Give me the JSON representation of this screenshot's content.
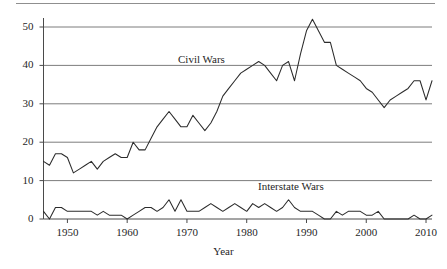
{
  "figure": {
    "background_color": "#ffffff",
    "line_color": "#2b2b2b",
    "grid_color": "#6e6e6e",
    "axis_color": "#4a4a4a"
  },
  "axis_titles": {
    "x": "Year",
    "y": ""
  },
  "series_labels": {
    "civil_wars": "Civil Wars",
    "interstate_wars": "Interstate Wars"
  },
  "chart_data": {
    "type": "line",
    "title": "",
    "subtitle": "",
    "xlabel": "Year",
    "ylabel": "",
    "xlim": [
      1946,
      2011
    ],
    "ylim": [
      0,
      52
    ],
    "xticks": [
      1950,
      1960,
      1970,
      1980,
      1990,
      2000,
      2010
    ],
    "xtick_labels": [
      "1950",
      "1960",
      "1970",
      "1980",
      "1990",
      "2000",
      "2010"
    ],
    "yticks": [
      0,
      10,
      20,
      30,
      40,
      50
    ],
    "ytick_labels": [
      "0",
      "10",
      "20",
      "30",
      "40",
      "50"
    ],
    "grid": "horizontal",
    "legend_position": "inline-annotations",
    "annotations": [
      {
        "text": "Civil Wars",
        "x": 1975,
        "y": 43
      },
      {
        "text": "Interstate Wars",
        "x": 1992,
        "y": 7.5
      }
    ],
    "x": [
      1946,
      1947,
      1948,
      1949,
      1950,
      1951,
      1952,
      1953,
      1954,
      1955,
      1956,
      1957,
      1958,
      1959,
      1960,
      1961,
      1962,
      1963,
      1964,
      1965,
      1966,
      1967,
      1968,
      1969,
      1970,
      1971,
      1972,
      1973,
      1974,
      1975,
      1976,
      1977,
      1978,
      1979,
      1980,
      1981,
      1982,
      1983,
      1984,
      1985,
      1986,
      1987,
      1988,
      1989,
      1990,
      1991,
      1992,
      1993,
      1994,
      1995,
      1996,
      1997,
      1998,
      1999,
      2000,
      2001,
      2002,
      2003,
      2004,
      2005,
      2006,
      2007,
      2008,
      2009,
      2010,
      2011
    ],
    "series": [
      {
        "name": "Civil Wars",
        "values": [
          15,
          14,
          17,
          17,
          16,
          12,
          13,
          14,
          15,
          13,
          15,
          16,
          17,
          16,
          16,
          20,
          18,
          18,
          21,
          24,
          26,
          28,
          26,
          24,
          24,
          27,
          25,
          23,
          25,
          28,
          32,
          34,
          36,
          38,
          39,
          40,
          41,
          40,
          38,
          36,
          40,
          41,
          36,
          43,
          49,
          52,
          49,
          46,
          46,
          40,
          39,
          38,
          37,
          36,
          34,
          33,
          31,
          29,
          31,
          32,
          33,
          34,
          36,
          36,
          31,
          36
        ]
      },
      {
        "name": "Interstate Wars",
        "values": [
          2,
          0,
          3,
          3,
          2,
          2,
          2,
          2,
          2,
          1,
          2,
          1,
          1,
          1,
          0,
          1,
          2,
          3,
          3,
          2,
          3,
          5,
          2,
          5,
          2,
          2,
          2,
          3,
          4,
          3,
          2,
          3,
          4,
          3,
          2,
          4,
          3,
          4,
          3,
          2,
          3,
          5,
          3,
          2,
          2,
          2,
          1,
          0,
          0,
          2,
          1,
          2,
          2,
          2,
          1,
          1,
          2,
          0,
          0,
          0,
          0,
          0,
          1,
          0,
          0,
          1
        ]
      }
    ]
  }
}
